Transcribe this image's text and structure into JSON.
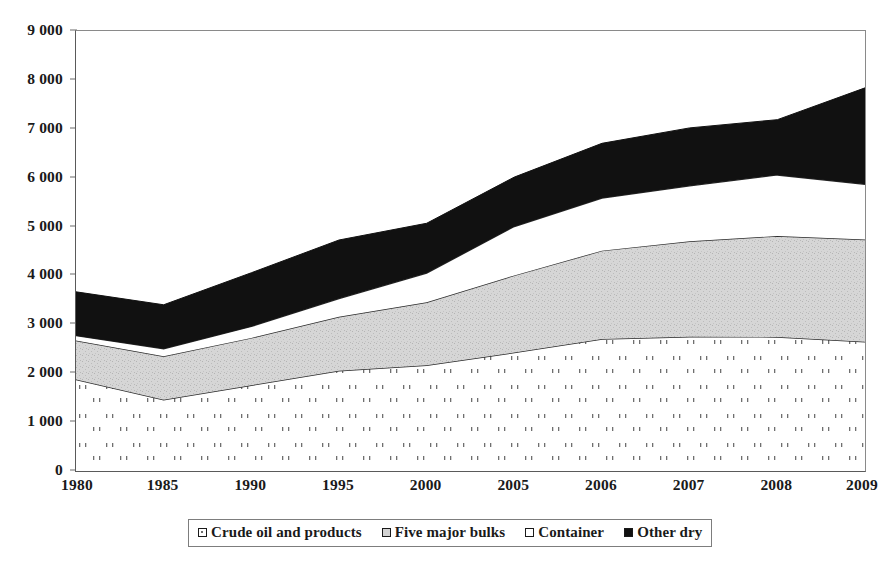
{
  "chart_data": {
    "type": "area",
    "stacked": true,
    "title": "",
    "subtitle": "",
    "xlabel": "",
    "ylabel": "",
    "grid": false,
    "legend_position": "bottom",
    "ylim": [
      0,
      9000
    ],
    "ytick_step": 1000,
    "ytick_labels": [
      "0",
      "1 000",
      "2 000",
      "3 000",
      "4 000",
      "5 000",
      "6 000",
      "7 000",
      "8 000",
      "9 000"
    ],
    "ytick_values": [
      0,
      1000,
      2000,
      3000,
      4000,
      5000,
      6000,
      7000,
      8000,
      9000
    ],
    "categories": [
      "1980",
      "1985",
      "1990",
      "1995",
      "2000",
      "2005",
      "2006",
      "2007",
      "2008",
      "2009"
    ],
    "x": [
      1980,
      1985,
      1990,
      1995,
      2000,
      2005,
      2006,
      2007,
      2008,
      2009
    ],
    "series": [
      {
        "name": "Crude oil and products",
        "fill": "white-dotted",
        "color": "#ffffff",
        "values": [
          1871,
          1459,
          1755,
          2050,
          2163,
          2422,
          2698,
          2747,
          2742,
          2642
        ]
      },
      {
        "name": "Five major bulks",
        "fill": "light-grey",
        "color": "#d2d2d2",
        "values": [
          796,
          889,
          968,
          1105,
          1288,
          1579,
          1809,
          1953,
          2065,
          2094
        ]
      },
      {
        "name": "Container",
        "fill": "white",
        "color": "#ffffff",
        "values": [
          102,
          152,
          234,
          371,
          598,
          1001,
          1076,
          1133,
          1249,
          1127
        ]
      },
      {
        "name": "Other dry",
        "fill": "black",
        "color": "#111111",
        "values": [
          896,
          900,
          1098,
          1199,
          1018,
          1010,
          1120,
          1185,
          1130,
          1974
        ]
      }
    ],
    "stack_totals": [
      3665,
      3400,
      4055,
      4725,
      5067,
      6012,
      6703,
      7018,
      7186,
      7837
    ],
    "cumulative_boundaries": {
      "crude_top": [
        1871,
        1459,
        1755,
        2050,
        2163,
        2422,
        2698,
        2747,
        2742,
        2642
      ],
      "bulks_top": [
        2667,
        2348,
        2723,
        3155,
        3451,
        4001,
        4507,
        4700,
        4807,
        4736
      ],
      "container_top": [
        2769,
        2500,
        2957,
        3526,
        4049,
        5002,
        5583,
        5833,
        6056,
        5863
      ],
      "other_dry_top": [
        3665,
        3400,
        4055,
        4725,
        5067,
        6012,
        6703,
        7018,
        7186,
        7837
      ]
    },
    "note_units": ""
  },
  "axes": {
    "y_ticks": [
      {
        "label": "9 000",
        "value": 9000
      },
      {
        "label": "8 000",
        "value": 8000
      },
      {
        "label": "7 000",
        "value": 7000
      },
      {
        "label": "6 000",
        "value": 6000
      },
      {
        "label": "5 000",
        "value": 5000
      },
      {
        "label": "4 000",
        "value": 4000
      },
      {
        "label": "3 000",
        "value": 3000
      },
      {
        "label": "2 000",
        "value": 2000
      },
      {
        "label": "1 000",
        "value": 1000
      },
      {
        "label": "0",
        "value": 0
      }
    ],
    "x_ticks": [
      {
        "label": "1980"
      },
      {
        "label": "1985"
      },
      {
        "label": "1990"
      },
      {
        "label": "1995"
      },
      {
        "label": "2000"
      },
      {
        "label": "2005"
      },
      {
        "label": "2006"
      },
      {
        "label": "2007"
      },
      {
        "label": "2008"
      },
      {
        "label": "2009"
      }
    ]
  },
  "legend": {
    "items": [
      {
        "label": "Crude oil and products",
        "swatch": "dot"
      },
      {
        "label": "Five major bulks",
        "swatch": "grey"
      },
      {
        "label": "Container",
        "swatch": "white"
      },
      {
        "label": "Other dry",
        "swatch": "black"
      }
    ]
  },
  "colors": {
    "black": "#111111",
    "grey": "#d2d2d2",
    "white": "#ffffff",
    "axis": "#5a5a5a",
    "dots": "#6f6f6f"
  }
}
